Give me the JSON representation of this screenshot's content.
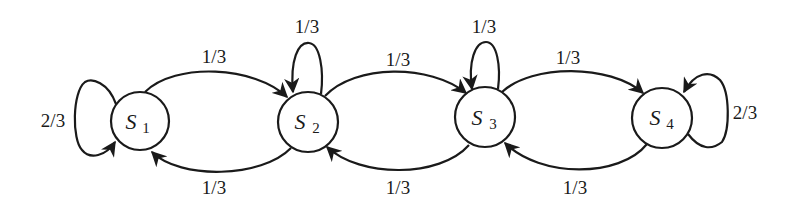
{
  "diagram": {
    "type": "markov-chain state transition diagram",
    "nodes": [
      {
        "id": "S1",
        "name": "S",
        "sub": "1",
        "cx": 140,
        "cy": 121,
        "r": 29
      },
      {
        "id": "S2",
        "name": "S",
        "sub": "2",
        "cx": 308,
        "cy": 122,
        "r": 30
      },
      {
        "id": "S3",
        "name": "S",
        "sub": "3",
        "cx": 485,
        "cy": 117,
        "r": 30
      },
      {
        "id": "S4",
        "name": "S",
        "sub": "4",
        "cx": 662,
        "cy": 118,
        "r": 30
      }
    ],
    "edges": [
      {
        "from": "S1",
        "to": "S1",
        "label": "2/3"
      },
      {
        "from": "S1",
        "to": "S2",
        "label": "1/3"
      },
      {
        "from": "S2",
        "to": "S1",
        "label": "1/3"
      },
      {
        "from": "S2",
        "to": "S2",
        "label": "1/3"
      },
      {
        "from": "S2",
        "to": "S3",
        "label": "1/3"
      },
      {
        "from": "S3",
        "to": "S2",
        "label": "1/3"
      },
      {
        "from": "S3",
        "to": "S3",
        "label": "1/3"
      },
      {
        "from": "S3",
        "to": "S4",
        "label": "1/3"
      },
      {
        "from": "S4",
        "to": "S3",
        "label": "1/3"
      },
      {
        "from": "S4",
        "to": "S4",
        "label": "2/3"
      }
    ]
  }
}
